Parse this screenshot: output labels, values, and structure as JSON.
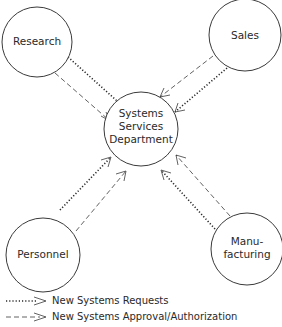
{
  "diagram": {
    "center": {
      "label_lines": [
        "Systems",
        "Services",
        "Department"
      ],
      "cx": 141,
      "cy": 129,
      "r": 37
    },
    "nodes": [
      {
        "id": "research",
        "label_lines": [
          "Research"
        ],
        "cx": 37,
        "cy": 42,
        "r": 35
      },
      {
        "id": "sales",
        "label_lines": [
          "Sales"
        ],
        "cx": 245,
        "cy": 35,
        "r": 36
      },
      {
        "id": "personnel",
        "label_lines": [
          "Personnel"
        ],
        "cx": 43,
        "cy": 255,
        "r": 37
      },
      {
        "id": "manufacturing",
        "label_lines": [
          "Manu-",
          "facturing"
        ],
        "cx": 247,
        "cy": 249,
        "r": 36
      }
    ],
    "flows": [
      {
        "from": "research",
        "to": "center",
        "type": "requests"
      },
      {
        "from": "research",
        "to": "center",
        "type": "approval"
      },
      {
        "from": "sales",
        "to": "center",
        "type": "requests"
      },
      {
        "from": "sales",
        "to": "center",
        "type": "approval"
      },
      {
        "from": "personnel",
        "to": "center",
        "type": "requests"
      },
      {
        "from": "personnel",
        "to": "center",
        "type": "approval"
      },
      {
        "from": "manufacturing",
        "to": "center",
        "type": "requests"
      },
      {
        "from": "manufacturing",
        "to": "center",
        "type": "approval"
      }
    ]
  },
  "legend": {
    "items": [
      {
        "line_style": "dotted",
        "label": "New Systems Requests"
      },
      {
        "line_style": "dashed",
        "label": "New Systems Approval/Authorization"
      }
    ]
  }
}
